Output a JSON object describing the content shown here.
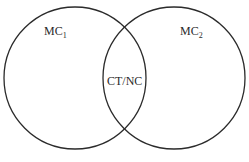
{
  "diagram": {
    "type": "venn",
    "sets": [
      {
        "id": "left",
        "label": "MC",
        "subscript": "1",
        "cx": 75,
        "cy": 78,
        "r": 71
      },
      {
        "id": "right",
        "label": "MC",
        "subscript": "2",
        "cx": 174,
        "cy": 78,
        "r": 71
      }
    ],
    "intersection": {
      "label": "CT/NC"
    },
    "stroke_color": "#2b2b2b",
    "background": "#ffffff"
  }
}
